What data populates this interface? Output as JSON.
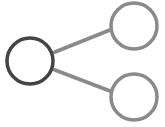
{
  "icon": {
    "name": "share-network-icon",
    "colors": {
      "primary_node": "#444444",
      "secondary_node": "#8a8a8a",
      "connector": "#8a8a8a",
      "background": "#ffffff"
    },
    "nodes": [
      {
        "id": "source",
        "cx": 30,
        "cy": 61,
        "r": 23
      },
      {
        "id": "target-top",
        "cx": 134,
        "cy": 26,
        "r": 23
      },
      {
        "id": "target-bottom",
        "cx": 134,
        "cy": 97,
        "r": 23
      }
    ],
    "edges": [
      {
        "from": "source",
        "to": "target-top",
        "x1": 55,
        "y1": 52,
        "x2": 110,
        "y2": 30
      },
      {
        "from": "source",
        "to": "target-bottom",
        "x1": 55,
        "y1": 70,
        "x2": 110,
        "y2": 91
      }
    ]
  }
}
